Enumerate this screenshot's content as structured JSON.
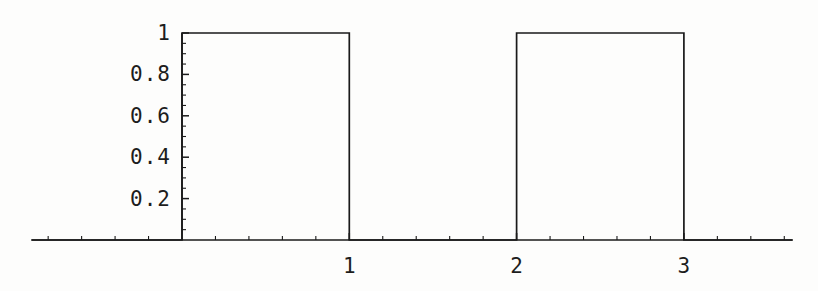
{
  "chart_data": {
    "type": "line",
    "title": "",
    "subtitle": "",
    "xlabel": "",
    "ylabel": "",
    "xlim": [
      -0.9,
      3.65
    ],
    "ylim": [
      0,
      1.04
    ],
    "grid": false,
    "legend": null,
    "series": [
      {
        "name": "square wave",
        "color": "#1a1a1a",
        "x": [
          -0.9,
          0,
          0,
          1,
          1,
          2,
          2,
          3,
          3,
          3.65
        ],
        "y": [
          0,
          0,
          1,
          1,
          0,
          0,
          1,
          1,
          0,
          0
        ]
      }
    ],
    "pulses": [
      {
        "start": 0,
        "end": 1,
        "height": 1
      },
      {
        "start": 2,
        "end": 3,
        "height": 1
      }
    ],
    "x_ticks_major": [
      {
        "value": 1,
        "label": "1"
      },
      {
        "value": 2,
        "label": "2"
      },
      {
        "value": 3,
        "label": "3"
      }
    ],
    "x_ticks_minor": [
      -0.8,
      -0.6,
      -0.4,
      -0.2,
      0.2,
      0.4,
      0.6,
      0.8,
      1.2,
      1.4,
      1.6,
      1.8,
      2.2,
      2.4,
      2.6,
      2.8,
      3.2,
      3.4,
      3.6
    ],
    "y_ticks_major": [
      {
        "value": 1,
        "label": "1"
      },
      {
        "value": 0.8,
        "label": "0.8"
      },
      {
        "value": 0.6,
        "label": "0.6"
      },
      {
        "value": 0.4,
        "label": "0.4"
      },
      {
        "value": 0.2,
        "label": "0.2"
      }
    ],
    "y_ticks_minor": [
      0.05,
      0.1,
      0.15,
      0.25,
      0.3,
      0.35,
      0.45,
      0.5,
      0.55,
      0.65,
      0.7,
      0.75,
      0.85,
      0.9,
      0.95
    ]
  },
  "axes": {
    "x_axis_name": "horizontal-axis",
    "y_axis_name": "vertical-axis",
    "axis_color": "#1a1a1a",
    "background_color": "#fdfdfc"
  }
}
